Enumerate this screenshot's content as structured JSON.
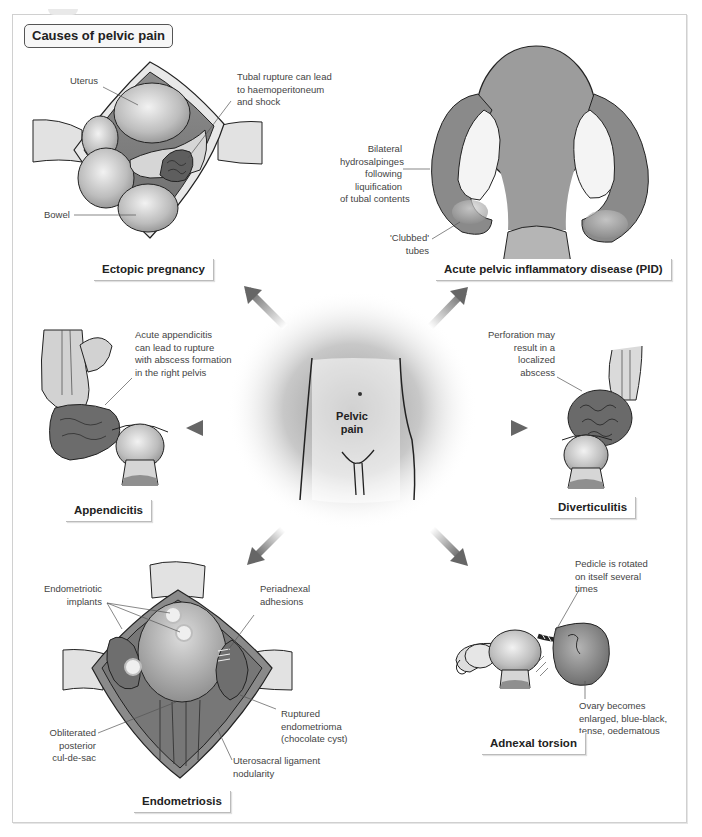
{
  "figure": {
    "title": "Causes of pelvic pain",
    "center_label": "Pelvic pain",
    "center_label_lines": [
      "Pelvic",
      "pain"
    ],
    "colors": {
      "arrow_dark": "#6a6a6a",
      "arrow_light": "#d8d8d8",
      "tissue_light": "#d9d9d9",
      "tissue_mid": "#a8a8a8",
      "tissue_dark": "#6e6e6e",
      "outline": "#222222",
      "frame_border": "#d0d0d0"
    }
  },
  "panels": {
    "ectopic": {
      "caption": "Ectopic pregnancy",
      "labels": {
        "uterus": "Uterus",
        "bowel": "Bowel",
        "rupture": [
          "Tubal rupture can lead",
          "to haemoperitoneum",
          "and shock"
        ]
      }
    },
    "pid": {
      "caption": "Acute pelvic inflammatory disease (PID)",
      "labels": {
        "hydrosalpinges": [
          "Bilateral",
          "hydrosalpinges",
          "following",
          "liquification",
          "of tubal contents"
        ],
        "clubbed": [
          "'Clubbed'",
          "tubes"
        ]
      }
    },
    "appendicitis": {
      "caption": "Appendicitis",
      "labels": {
        "note": [
          "Acute appendicitis",
          "can lead to rupture",
          "with abscess formation",
          "in the right pelvis"
        ]
      }
    },
    "diverticulitis": {
      "caption": "Diverticulitis",
      "labels": {
        "note": [
          "Perforation may",
          "result in a",
          "localized",
          "abscess"
        ]
      }
    },
    "endometriosis": {
      "caption": "Endometriosis",
      "labels": {
        "implants": [
          "Endometriotic",
          "implants"
        ],
        "adhesions": [
          "Periadnexal",
          "adhesions"
        ],
        "endometrioma": [
          "Ruptured",
          "endometrioma",
          "(chocolate cyst)"
        ],
        "culdesac": [
          "Obliterated",
          "posterior",
          "cul-de-sac"
        ],
        "uterosacral": [
          "Uterosacral ligament",
          "nodularity"
        ]
      }
    },
    "torsion": {
      "caption": "Adnexal torsion",
      "labels": {
        "pedicle": [
          "Pedicle is rotated",
          "on itself several",
          "times"
        ],
        "ovary": [
          "Ovary becomes",
          "enlarged, blue-black,",
          "tense, oedematous"
        ]
      }
    }
  }
}
